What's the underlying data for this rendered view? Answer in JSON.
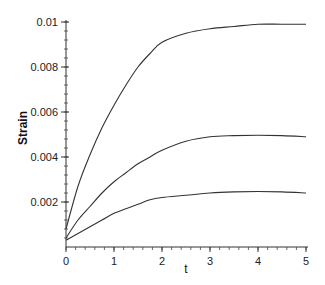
{
  "chart_data": {
    "type": "line",
    "title": "",
    "xlabel": "t",
    "ylabel": "Strain",
    "xlim": [
      0,
      5
    ],
    "ylim": [
      0,
      0.01
    ],
    "grid": false,
    "legend": null,
    "x_ticks": [
      0,
      1,
      2,
      3,
      4,
      5
    ],
    "x_tick_labels": [
      "0",
      "1",
      "2",
      "3",
      "4",
      "5"
    ],
    "x_minor_step": 0.2,
    "y_ticks": [
      0.002,
      0.004,
      0.006,
      0.008,
      0.01
    ],
    "y_tick_labels": [
      "0.002",
      "0.004",
      "0.006",
      "0.008",
      "0.01"
    ],
    "y_minor_step": 0.0004,
    "x": [
      0,
      0.25,
      0.5,
      0.75,
      1,
      1.25,
      1.5,
      1.75,
      2,
      2.5,
      3,
      3.5,
      4,
      4.5,
      5
    ],
    "series": [
      {
        "name": "curve-high",
        "color": "#333333",
        "values": [
          0.0008,
          0.0027,
          0.0041,
          0.0053,
          0.0063,
          0.0072,
          0.008,
          0.0086,
          0.0091,
          0.0095,
          0.0097,
          0.0098,
          0.0099,
          0.0099,
          0.0099
        ]
      },
      {
        "name": "curve-mid",
        "color": "#333333",
        "values": [
          0.0004,
          0.0012,
          0.0018,
          0.0024,
          0.0029,
          0.0033,
          0.0037,
          0.004,
          0.0043,
          0.0047,
          0.0049,
          0.00495,
          0.00497,
          0.00495,
          0.0049
        ]
      },
      {
        "name": "curve-low",
        "color": "#333333",
        "values": [
          0.0003,
          0.0006,
          0.0009,
          0.0012,
          0.0015,
          0.0017,
          0.0019,
          0.0021,
          0.0022,
          0.0023,
          0.0024,
          0.00245,
          0.00247,
          0.00245,
          0.0024
        ]
      }
    ]
  }
}
